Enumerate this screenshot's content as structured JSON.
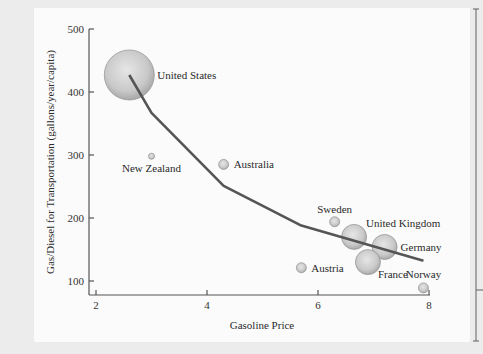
{
  "chart_data": {
    "type": "scatter",
    "title": "",
    "xlabel": "Gasoline Price",
    "ylabel": "Gas/Diesel for Transportation (gallons/year/capita)",
    "xlim": [
      1.8,
      8.1
    ],
    "ylim": [
      80,
      500
    ],
    "x_ticks": [
      2,
      4,
      6,
      8
    ],
    "y_ticks": [
      100,
      200,
      300,
      400,
      500
    ],
    "grid": false,
    "legend": null,
    "points": [
      {
        "label": "United States",
        "x": 2.6,
        "y": 427,
        "size": "large"
      },
      {
        "label": "New Zealand",
        "x": 3.0,
        "y": 298,
        "size": "tiny"
      },
      {
        "label": "Australia",
        "x": 4.3,
        "y": 285,
        "size": "small"
      },
      {
        "label": "Sweden",
        "x": 6.3,
        "y": 194,
        "size": "small"
      },
      {
        "label": "United Kingdom",
        "x": 6.65,
        "y": 170,
        "size": "medium"
      },
      {
        "label": "Germany",
        "x": 7.2,
        "y": 154,
        "size": "medium"
      },
      {
        "label": "France",
        "x": 6.9,
        "y": 130,
        "size": "medium"
      },
      {
        "label": "Austria",
        "x": 5.7,
        "y": 121,
        "size": "small"
      },
      {
        "label": "Norway",
        "x": 7.9,
        "y": 89,
        "size": "small"
      }
    ],
    "trend_line": {
      "x": [
        2.6,
        3.0,
        4.3,
        5.7,
        7.9
      ],
      "y": [
        427,
        367,
        251,
        188,
        132
      ]
    }
  }
}
